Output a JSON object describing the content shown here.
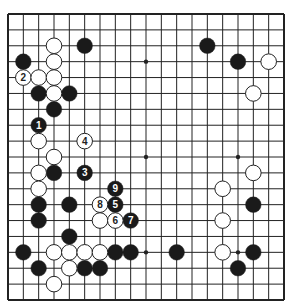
{
  "board": {
    "size": 19,
    "origin": {
      "x": 8,
      "y": 14
    },
    "end": {
      "x": 284,
      "y": 300
    },
    "stone_radius": 7.8,
    "colors": {
      "line": "#222222",
      "black": "#1a1a1a",
      "white": "#ffffff",
      "background": "#ffffff"
    },
    "star_points": [
      [
        3,
        3
      ],
      [
        9,
        3
      ],
      [
        15,
        3
      ],
      [
        3,
        9
      ],
      [
        9,
        9
      ],
      [
        15,
        9
      ],
      [
        3,
        15
      ],
      [
        9,
        15
      ],
      [
        15,
        15
      ]
    ]
  },
  "stones": [
    {
      "color": "black",
      "col": 5,
      "row": 2
    },
    {
      "color": "black",
      "col": 13,
      "row": 2
    },
    {
      "color": "black",
      "col": 1,
      "row": 3
    },
    {
      "color": "black",
      "col": 15,
      "row": 3
    },
    {
      "color": "black",
      "col": 2,
      "row": 5
    },
    {
      "color": "black",
      "col": 4,
      "row": 5
    },
    {
      "color": "black",
      "col": 3,
      "row": 6
    },
    {
      "color": "black",
      "col": 2,
      "row": 7,
      "label": "1"
    },
    {
      "color": "black",
      "col": 3,
      "row": 10
    },
    {
      "color": "black",
      "col": 5,
      "row": 10,
      "label": "3"
    },
    {
      "color": "black",
      "col": 7,
      "row": 11,
      "label": "9"
    },
    {
      "color": "black",
      "col": 2,
      "row": 12
    },
    {
      "color": "black",
      "col": 4,
      "row": 12
    },
    {
      "color": "black",
      "col": 7,
      "row": 12,
      "label": "5"
    },
    {
      "color": "black",
      "col": 16,
      "row": 12
    },
    {
      "color": "black",
      "col": 2,
      "row": 13
    },
    {
      "color": "black",
      "col": 8,
      "row": 13,
      "label": "7"
    },
    {
      "color": "black",
      "col": 4,
      "row": 14
    },
    {
      "color": "black",
      "col": 1,
      "row": 15
    },
    {
      "color": "black",
      "col": 7,
      "row": 15
    },
    {
      "color": "black",
      "col": 8,
      "row": 15
    },
    {
      "color": "black",
      "col": 11,
      "row": 15
    },
    {
      "color": "black",
      "col": 16,
      "row": 15
    },
    {
      "color": "black",
      "col": 2,
      "row": 16
    },
    {
      "color": "black",
      "col": 5,
      "row": 16
    },
    {
      "color": "black",
      "col": 6,
      "row": 16
    },
    {
      "color": "black",
      "col": 15,
      "row": 16
    },
    {
      "color": "white",
      "col": 3,
      "row": 2
    },
    {
      "color": "white",
      "col": 3,
      "row": 3
    },
    {
      "color": "white",
      "col": 17,
      "row": 3
    },
    {
      "color": "white",
      "col": 1,
      "row": 4,
      "label": "2"
    },
    {
      "color": "white",
      "col": 2,
      "row": 4
    },
    {
      "color": "white",
      "col": 3,
      "row": 4
    },
    {
      "color": "white",
      "col": 3,
      "row": 5
    },
    {
      "color": "white",
      "col": 16,
      "row": 5
    },
    {
      "color": "white",
      "col": 2,
      "row": 8
    },
    {
      "color": "white",
      "col": 5,
      "row": 8,
      "label": "4"
    },
    {
      "color": "white",
      "col": 3,
      "row": 9
    },
    {
      "color": "white",
      "col": 2,
      "row": 10
    },
    {
      "color": "white",
      "col": 16,
      "row": 10
    },
    {
      "color": "white",
      "col": 2,
      "row": 11
    },
    {
      "color": "white",
      "col": 14,
      "row": 11
    },
    {
      "color": "white",
      "col": 6,
      "row": 12,
      "label": "8"
    },
    {
      "color": "white",
      "col": 6,
      "row": 13
    },
    {
      "color": "white",
      "col": 7,
      "row": 13,
      "label": "6"
    },
    {
      "color": "white",
      "col": 14,
      "row": 13
    },
    {
      "color": "white",
      "col": 3,
      "row": 15
    },
    {
      "color": "white",
      "col": 4,
      "row": 15
    },
    {
      "color": "white",
      "col": 5,
      "row": 15
    },
    {
      "color": "white",
      "col": 6,
      "row": 15
    },
    {
      "color": "white",
      "col": 14,
      "row": 15
    },
    {
      "color": "white",
      "col": 4,
      "row": 16
    },
    {
      "color": "white",
      "col": 3,
      "row": 17
    }
  ]
}
